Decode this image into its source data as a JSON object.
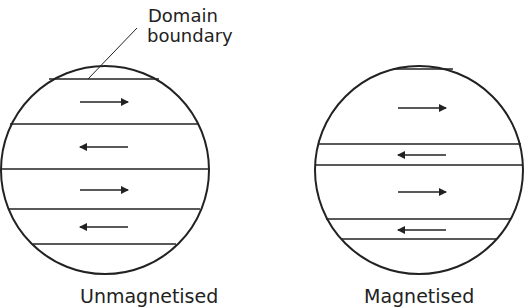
{
  "annotation": {
    "line1": "Domain",
    "line2": "boundary"
  },
  "panels": [
    {
      "caption": "Unmagnetised",
      "domains": [
        {
          "direction": "right"
        },
        {
          "direction": "left"
        },
        {
          "direction": "right"
        },
        {
          "direction": "left"
        }
      ]
    },
    {
      "caption": "Magnetised",
      "domains": [
        {
          "direction": "right"
        },
        {
          "direction": "left"
        },
        {
          "direction": "right"
        },
        {
          "direction": "left"
        }
      ]
    }
  ],
  "colors": {
    "stroke": "#222222"
  }
}
